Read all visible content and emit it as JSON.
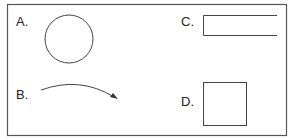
{
  "diagram": {
    "frame": {
      "x": 7,
      "y": 4,
      "width": 279,
      "height": 131,
      "stroke": "#555555"
    },
    "stroke_color": "#444444",
    "panels": [
      {
        "id": "A",
        "label": "A.",
        "shape": "circle",
        "description": "circle outline"
      },
      {
        "id": "B",
        "label": "B.",
        "shape": "curved-arrow",
        "description": "curved arc with arrowhead pointing right-down"
      },
      {
        "id": "C",
        "label": "C.",
        "shape": "open-rectangle",
        "description": "rectangle open on the right side"
      },
      {
        "id": "D",
        "label": "D.",
        "shape": "square",
        "description": "square outline"
      }
    ]
  }
}
